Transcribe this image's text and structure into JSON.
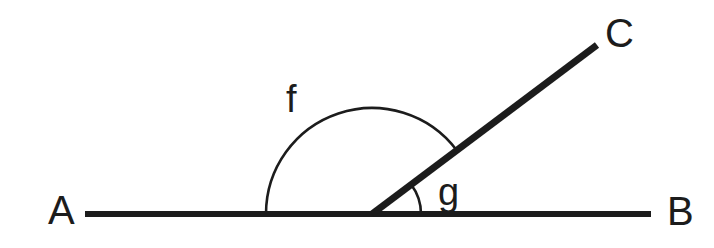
{
  "figure": {
    "kind": "angle-diagram",
    "caption": "Straight line A-B with ray from vertex to C forming supplementary angles f and g",
    "background_color": "#ffffff",
    "stroke_color": "#1c1c1c",
    "arc_color": "#1c1c1c"
  },
  "points": {
    "a": {
      "label": "A",
      "x": 48,
      "y": 224,
      "font_size": 40
    },
    "b": {
      "label": "B",
      "x": 667,
      "y": 225,
      "font_size": 40
    },
    "c": {
      "label": "C",
      "x": 605,
      "y": 47,
      "font_size": 40
    }
  },
  "angles": {
    "f": {
      "label": "f",
      "label_x": 286,
      "label_y": 112,
      "font_size": 38,
      "radius": 106,
      "start_deg": 180,
      "end_deg": 37,
      "measure_note": "obtuse angle between ray AO and ray OC"
    },
    "g": {
      "label": "g",
      "label_x": 438,
      "label_y": 205,
      "font_size": 38,
      "radius": 49,
      "start_deg": 37,
      "end_deg": 0,
      "measure_note": "acute angle between ray OC and ray OB"
    }
  },
  "segments": {
    "line_ab": {
      "name": "AB",
      "x1": 85,
      "y1": 214,
      "x2": 651,
      "y2": 214,
      "stroke_width": 6
    },
    "ray_oc": {
      "name": "OC",
      "x1": 372,
      "y1": 214,
      "x2": 597,
      "y2": 45,
      "stroke_width": 7
    }
  },
  "vertex": {
    "name": "O",
    "x": 372,
    "y": 214
  },
  "arc_paths": {
    "f_path": "M 266 214 A 106 106 0 0 1 456.65 150.20",
    "g_path": "M 421 214 A 49 49 0 0 0 411.13 184.51"
  }
}
